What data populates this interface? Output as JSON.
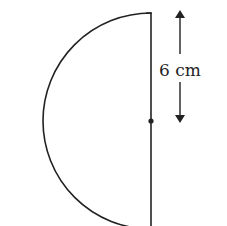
{
  "diagram": {
    "shape": "semicircle",
    "orientation": "curved side left, diameter vertical on right",
    "center_marked": true,
    "dimension": {
      "label": "6 cm",
      "measures": "radius (top of diameter to center)"
    },
    "colors": {
      "stroke": "#222222",
      "background": "#ffffff"
    }
  }
}
